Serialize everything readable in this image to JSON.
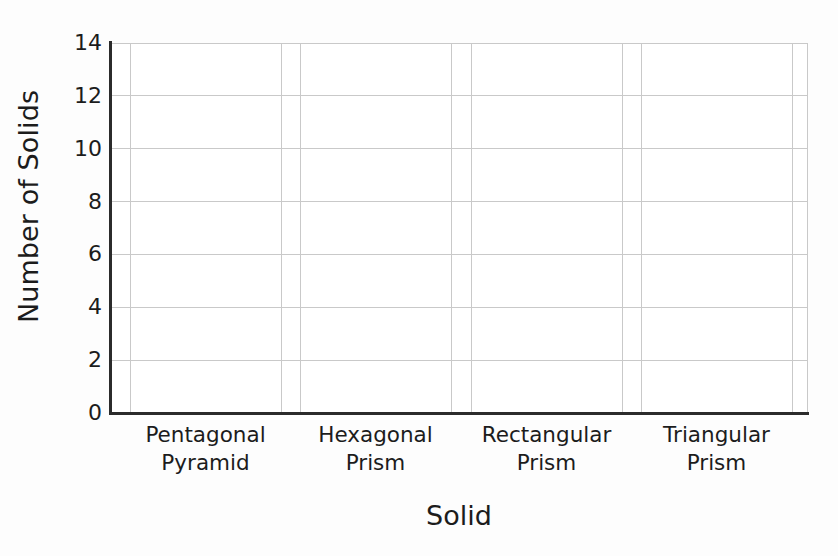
{
  "chart_data": {
    "type": "bar",
    "title": "",
    "subtitle": "",
    "xlabel": "Solid",
    "ylabel": "Number of Solids",
    "categories": [
      "Pentagonal Pyramid",
      "Hexagonal Prism",
      "Rectangular Prism",
      "Triangular Prism"
    ],
    "category_lines": [
      {
        "line1": "Pentagonal",
        "line2": "Pyramid"
      },
      {
        "line1": "Hexagonal",
        "line2": "Prism"
      },
      {
        "line1": "Rectangular",
        "line2": "Prism"
      },
      {
        "line1": "Triangular",
        "line2": "Prism"
      }
    ],
    "values": [
      null,
      null,
      null,
      null
    ],
    "ylim": [
      0,
      14
    ],
    "y_tick_step": 2,
    "y_ticks": [
      0,
      2,
      4,
      6,
      8,
      10,
      12,
      14
    ],
    "y_tick_labels": [
      "0",
      "2",
      "4",
      "6",
      "8",
      "10",
      "12",
      "14"
    ],
    "grid": true,
    "grid_axis": "both",
    "legend": false,
    "legend_position": "none",
    "note": "Blank bar-graph template: axes and gridlines drawn, no bars plotted."
  },
  "style": {
    "background_color": "#fdfdfd",
    "plot_background_color": "#ffffff",
    "axis_line_color": "#2b2b2b",
    "gridline_color": "#c9c9c9",
    "text_color": "#1c1c1c"
  },
  "geometry": {
    "plot_left": 110,
    "plot_top": 43,
    "plot_right": 808,
    "plot_bottom": 413,
    "band_edges": [
      [
        130,
        281
      ],
      [
        300,
        451
      ],
      [
        471,
        622
      ],
      [
        641,
        792
      ]
    ]
  }
}
